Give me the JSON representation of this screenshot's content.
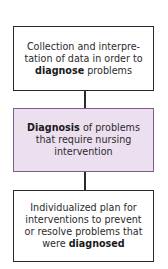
{
  "diagram": {
    "type": "flowchart",
    "direction": "top-to-bottom",
    "nodes": [
      {
        "id": "assessment",
        "text_before": "Collection and interpre-tation of data in order to ",
        "bold": "diagnose",
        "text_after": " problems",
        "fill": "#ffffff",
        "border": "#2a2a2a"
      },
      {
        "id": "diagnosis",
        "text_before": "",
        "bold": "Diagnosis",
        "text_after": " of problems that require nursing intervention",
        "fill": "#ecdff0",
        "border": "#7d5d8a"
      },
      {
        "id": "planning",
        "text_before": "Individualized plan for interventions to prevent or resolve problems that were ",
        "bold": "diagnosed",
        "text_after": "",
        "fill": "#ffffff",
        "border": "#2a2a2a"
      }
    ],
    "edges": [
      {
        "from": "assessment",
        "to": "diagnosis"
      },
      {
        "from": "diagnosis",
        "to": "planning"
      }
    ]
  }
}
